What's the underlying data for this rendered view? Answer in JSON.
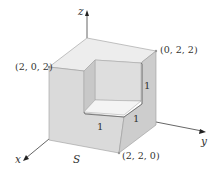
{
  "diagram": {
    "type": "3d-solid-surface",
    "axes": {
      "x_label": "x",
      "y_label": "y",
      "z_label": "z"
    },
    "vertex_labels": {
      "top_left": "(2, 0, 2)",
      "top_right": "(0, 2, 2)",
      "bottom_front": "(2, 2, 0)"
    },
    "surface_label": "S",
    "edge_labels": {
      "vertical_notch_edge": "1",
      "shelf_right_edge": "1",
      "shelf_front_edge": "1"
    },
    "colors": {
      "top_face": "#ececec",
      "front_face": "#d9d9d9",
      "right_face": "#cfcfcf",
      "notch_back": "#dcdcdc",
      "notch_left": "#c9c9c9",
      "shelf": "#f3f3f3",
      "edge": "#777777",
      "axis": "#555555"
    }
  }
}
